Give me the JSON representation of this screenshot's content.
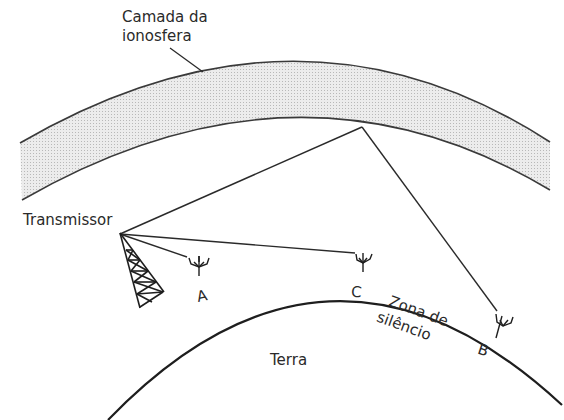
{
  "diagram": {
    "labels": {
      "ionosphere": [
        "Camada da",
        "ionosfera"
      ],
      "transmitter": "Transmissor",
      "receiver_a": "A",
      "receiver_c": "C",
      "receiver_b": "B",
      "silence_zone": [
        "Zona de",
        "silêncio"
      ],
      "earth": "Terra"
    },
    "colors": {
      "line": "#2a2a2a",
      "ionosphere_fill": "#e4e4e4",
      "background": "#ffffff"
    }
  }
}
